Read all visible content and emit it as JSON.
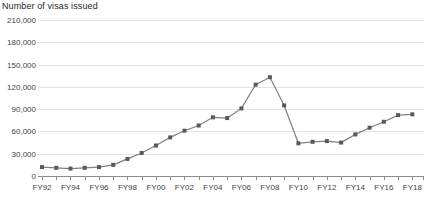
{
  "chart_data": {
    "type": "line",
    "title": "Number of visas issued",
    "xlabel": "",
    "ylabel": "",
    "ylim": [
      0,
      210000
    ],
    "ytick_step": 30000,
    "ytick_labels": [
      "210,000",
      "180,000",
      "150,000",
      "120,000",
      "90,000",
      "60,000",
      "30,000",
      "0"
    ],
    "ytick_values": [
      210000,
      180000,
      150000,
      120000,
      90000,
      60000,
      30000,
      0
    ],
    "grid": true,
    "legend": false,
    "x_tick_label_interval": 2,
    "categories": [
      "FY92",
      "FY93",
      "FY94",
      "FY95",
      "FY96",
      "FY97",
      "FY98",
      "FY99",
      "FY00",
      "FY01",
      "FY02",
      "FY03",
      "FY04",
      "FY05",
      "FY06",
      "FY07",
      "FY08",
      "FY09",
      "FY10",
      "FY11",
      "FY12",
      "FY13",
      "FY14",
      "FY15",
      "FY16",
      "FY17",
      "FY18"
    ],
    "visible_tick_labels": [
      "FY92",
      "FY94",
      "FY96",
      "FY98",
      "FY00",
      "FY02",
      "FY04",
      "FY06",
      "FY08",
      "FY10",
      "FY12",
      "FY14",
      "FY16",
      "FY18"
    ],
    "values": [
      12000,
      11000,
      10000,
      11000,
      12000,
      15000,
      23000,
      31000,
      41000,
      52000,
      61000,
      68000,
      79000,
      78000,
      91000,
      123000,
      133000,
      95000,
      44000,
      46000,
      47000,
      45000,
      56000,
      65000,
      73000,
      82000,
      83000
    ],
    "series": [
      {
        "name": "Number of visas issued",
        "color": "#808080",
        "marker_color": "#595959",
        "values": [
          12000,
          11000,
          10000,
          11000,
          12000,
          15000,
          23000,
          31000,
          41000,
          52000,
          61000,
          68000,
          79000,
          78000,
          91000,
          123000,
          133000,
          95000,
          44000,
          46000,
          47000,
          45000,
          56000,
          65000,
          73000,
          82000,
          83000
        ]
      }
    ]
  },
  "colors": {
    "line": "#808080",
    "marker": "#595959",
    "gridline": "#e4e4e4",
    "axis": "#8c8c8c",
    "text": "#3f3f3f",
    "title_text": "#262626",
    "background": "#ffffff"
  }
}
